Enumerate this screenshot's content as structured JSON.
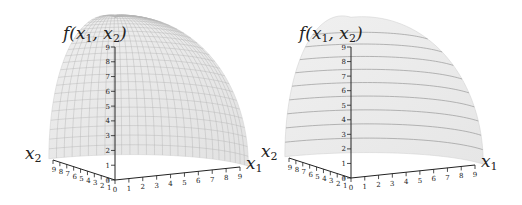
{
  "chart_data": [
    {
      "type": "surface3d",
      "title": "",
      "zlabel": "f(x1, x2)",
      "xlabel": "x1",
      "ylabel": "x2",
      "x_ticks": [
        "0",
        "1",
        "2",
        "3",
        "4",
        "5",
        "6",
        "7",
        "8",
        "9"
      ],
      "y_ticks": [
        "0",
        "1",
        "2",
        "3",
        "4",
        "5",
        "6",
        "7",
        "8",
        "9"
      ],
      "z_ticks": [
        "0",
        "1",
        "2",
        "3",
        "4",
        "5",
        "6",
        "7",
        "8",
        "9"
      ],
      "xlim": [
        0,
        9
      ],
      "ylim": [
        0,
        9
      ],
      "zlim": [
        0,
        9
      ],
      "style": "wireframe mesh (dense grid lines)",
      "surface_color": "#e6e6e6",
      "grid_color": "#b5b5b5"
    },
    {
      "type": "surface3d",
      "title": "",
      "zlabel": "f(x1, x2)",
      "xlabel": "x1",
      "ylabel": "x2",
      "x_ticks": [
        "0",
        "1",
        "2",
        "3",
        "4",
        "5",
        "6",
        "7",
        "8",
        "9"
      ],
      "y_ticks": [
        "0",
        "1",
        "2",
        "3",
        "4",
        "5",
        "6",
        "7",
        "8",
        "9"
      ],
      "z_ticks": [
        "0",
        "1",
        "2",
        "3",
        "4",
        "5",
        "6",
        "7",
        "8",
        "9"
      ],
      "xlim": [
        0,
        9
      ],
      "ylim": [
        0,
        9
      ],
      "zlim": [
        0,
        9
      ],
      "style": "shaded surface with level-set contour lines",
      "contour_levels": [
        1,
        2,
        3,
        4,
        5,
        6,
        7,
        8,
        9
      ],
      "surface_color": "#ebebeb",
      "grid_color": "#9a9a9a"
    }
  ],
  "labels": {
    "f": "f(",
    "x": "x",
    "sub1": "1",
    "sub2": "2",
    "comma": ",",
    "close": ")"
  }
}
